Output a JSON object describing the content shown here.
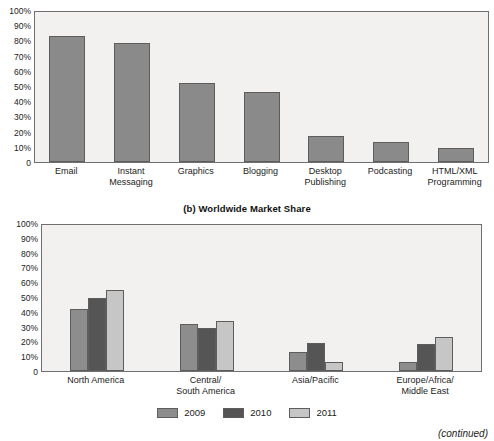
{
  "chart_data": [
    {
      "type": "bar",
      "title": "",
      "xlabel": "",
      "ylabel": "",
      "ylim": [
        0,
        100
      ],
      "ytick_labels": [
        "100%",
        "90%",
        "80%",
        "70%",
        "60%",
        "50%",
        "40%",
        "30%",
        "20%",
        "10%",
        "0"
      ],
      "ytick_values": [
        100,
        90,
        80,
        70,
        60,
        50,
        40,
        30,
        20,
        10,
        0
      ],
      "grid": false,
      "legend": null,
      "bar_color": "#8a8a8a",
      "categories": [
        "Email",
        "Instant\nMessaging",
        "Graphics",
        "Blogging",
        "Desktop\nPublishing",
        "Podcasting",
        "HTML/XML\nProgramming"
      ],
      "values": [
        83,
        78,
        52,
        46,
        17,
        13,
        9
      ]
    },
    {
      "type": "bar",
      "title": "(b) Worldwide Market Share",
      "xlabel": "",
      "ylabel": "",
      "ylim": [
        0,
        100
      ],
      "ytick_labels": [
        "100%",
        "90%",
        "80%",
        "70%",
        "60%",
        "50%",
        "40%",
        "30%",
        "20%",
        "10%",
        "0"
      ],
      "ytick_values": [
        100,
        90,
        80,
        70,
        60,
        50,
        40,
        30,
        20,
        10,
        0
      ],
      "grid": false,
      "legend_position": "bottom-center",
      "categories": [
        "North America",
        "Central/\nSouth America",
        "Asia/Pacific",
        "Europe/Africa/\nMiddle East"
      ],
      "series": [
        {
          "name": "2009",
          "color": "#8d8d8d",
          "values": [
            42,
            32,
            13,
            6
          ]
        },
        {
          "name": "2010",
          "color": "#555555",
          "values": [
            49,
            29,
            19,
            18
          ]
        },
        {
          "name": "2011",
          "color": "#c6c6c6",
          "values": [
            55,
            34,
            6,
            23
          ]
        }
      ]
    }
  ],
  "chart_a": {
    "clipped_heading": "",
    "yticks": [
      "100%",
      "90%",
      "80%",
      "70%",
      "60%",
      "50%",
      "40%",
      "30%",
      "20%",
      "10%",
      "0"
    ],
    "categories": [
      {
        "label": "Email",
        "value": 83
      },
      {
        "label": "Instant\nMessaging",
        "value": 78
      },
      {
        "label": "Graphics",
        "value": 52
      },
      {
        "label": "Blogging",
        "value": 46
      },
      {
        "label": "Desktop\nPublishing",
        "value": 17
      },
      {
        "label": "Podcasting",
        "value": 13
      },
      {
        "label": "HTML/XML\nProgramming",
        "value": 9
      }
    ]
  },
  "chart_b": {
    "title": "(b) Worldwide Market Share",
    "yticks": [
      "100%",
      "90%",
      "80%",
      "70%",
      "60%",
      "50%",
      "40%",
      "30%",
      "20%",
      "10%",
      "0"
    ],
    "categories": [
      "North America",
      "Central/\nSouth America",
      "Asia/Pacific",
      "Europe/Africa/\nMiddle East"
    ],
    "series": [
      {
        "name": "2009",
        "color": "#8d8d8d",
        "values": [
          42,
          32,
          13,
          6
        ]
      },
      {
        "name": "2010",
        "color": "#555555",
        "values": [
          49,
          29,
          19,
          18
        ]
      },
      {
        "name": "2011",
        "color": "#c6c6c6",
        "values": [
          55,
          34,
          6,
          23
        ]
      }
    ],
    "legend": [
      {
        "label": "2009",
        "color": "#8d8d8d"
      },
      {
        "label": "2010",
        "color": "#555555"
      },
      {
        "label": "2011",
        "color": "#c6c6c6"
      }
    ]
  },
  "footer": {
    "note": "(continued)"
  }
}
